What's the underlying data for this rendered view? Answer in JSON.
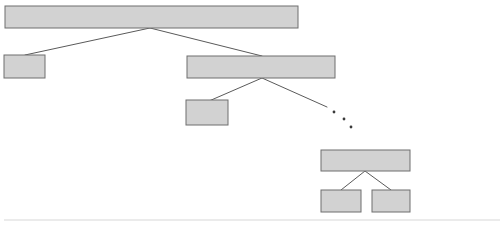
{
  "diagram": {
    "type": "tree",
    "title": "",
    "canvas": {
      "width": 504,
      "height": 227,
      "background": "#ffffff"
    },
    "style": {
      "node_fill": "#d2d2d2",
      "node_stroke": "#6e6e6e",
      "edge_stroke": "#5a5a5a",
      "dot_fill": "#3a3a3a",
      "rule_stroke": "#d8d8d8"
    },
    "nodes": [
      {
        "id": "root",
        "label": "",
        "x": 5,
        "y": 6,
        "w": 293,
        "h": 22,
        "level": 0
      },
      {
        "id": "child-left",
        "label": "",
        "x": 4,
        "y": 55,
        "w": 41,
        "h": 23,
        "level": 1
      },
      {
        "id": "child-right",
        "label": "",
        "x": 187,
        "y": 56,
        "w": 148,
        "h": 22,
        "level": 1
      },
      {
        "id": "grandchild",
        "label": "",
        "x": 186,
        "y": 100,
        "w": 42,
        "h": 25,
        "level": 2
      },
      {
        "id": "deep-parent",
        "label": "",
        "x": 321,
        "y": 150,
        "w": 89,
        "h": 21,
        "level": 4
      },
      {
        "id": "deep-left",
        "label": "",
        "x": 321,
        "y": 190,
        "w": 40,
        "h": 22,
        "level": 5
      },
      {
        "id": "deep-right",
        "label": "",
        "x": 372,
        "y": 190,
        "w": 38,
        "h": 22,
        "level": 5
      }
    ],
    "edges": [
      {
        "id": "edge-root-left",
        "x1": 150,
        "y1": 28,
        "x2": 25,
        "y2": 55,
        "from": "root",
        "to": "child-left"
      },
      {
        "id": "edge-root-right",
        "x1": 150,
        "y1": 28,
        "x2": 262,
        "y2": 56,
        "from": "root",
        "to": "child-right"
      },
      {
        "id": "edge-right-grandchild",
        "x1": 262,
        "y1": 78,
        "x2": 209,
        "y2": 101,
        "from": "child-right",
        "to": "grandchild"
      },
      {
        "id": "edge-right-ellipsis",
        "x1": 262,
        "y1": 78,
        "x2": 327,
        "y2": 107,
        "from": "child-right",
        "to": "ellipsis"
      },
      {
        "id": "edge-deep-left",
        "x1": 365,
        "y1": 171,
        "x2": 341,
        "y2": 190,
        "from": "deep-parent",
        "to": "deep-left"
      },
      {
        "id": "edge-deep-right",
        "x1": 365,
        "y1": 171,
        "x2": 391,
        "y2": 190,
        "from": "deep-parent",
        "to": "deep-right"
      }
    ],
    "ellipsis": {
      "meaning": "omitted-subtree",
      "dots": [
        {
          "cx": 334,
          "cy": 112,
          "r": 1.4
        },
        {
          "cx": 344,
          "cy": 119,
          "r": 1.4
        },
        {
          "cx": 351,
          "cy": 127,
          "r": 1.4
        }
      ]
    },
    "footer_rule": {
      "x1": 4,
      "y1": 220,
      "x2": 500,
      "y2": 220
    }
  }
}
